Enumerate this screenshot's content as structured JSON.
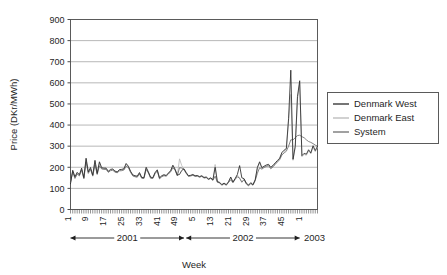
{
  "chart_data": {
    "type": "line",
    "title": "",
    "xlabel": "Week",
    "ylabel": "Price (DKr/MWh)",
    "ylim": [
      0,
      900
    ],
    "ytick_values": [
      0,
      100,
      200,
      300,
      400,
      500,
      600,
      700,
      800,
      900
    ],
    "ytick_labels": [
      "0",
      "100",
      "200",
      "300",
      "400",
      "500",
      "600",
      "700",
      "800",
      "900"
    ],
    "grid": true,
    "legend_position": "right",
    "xlim": [
      1,
      110
    ],
    "x_index_range": [
      1,
      110
    ],
    "xtick_positions": [
      1,
      9,
      17,
      25,
      33,
      41,
      49,
      57,
      65,
      73,
      81,
      89,
      97,
      105
    ],
    "xtick_labels": [
      "1",
      "9",
      "17",
      "25",
      "33",
      "41",
      "49",
      "5",
      "13",
      "21",
      "29",
      "37",
      "45",
      "1"
    ],
    "period_brackets": [
      {
        "label": "2001",
        "start_index": 1,
        "end_index": 52,
        "style": "double-arrow"
      },
      {
        "label": "2002",
        "start_index": 53,
        "end_index": 104,
        "style": "double-arrow"
      },
      {
        "label": "2003",
        "start_index": 105,
        "end_index": 110,
        "style": "text-right"
      }
    ],
    "series": [
      {
        "name": "Denmark West",
        "color": "#2b2b2b",
        "values": [
          122,
          186,
          155,
          176,
          165,
          196,
          151,
          243,
          178,
          199,
          163,
          233,
          171,
          226,
          198,
          196,
          196,
          181,
          190,
          192,
          182,
          178,
          189,
          190,
          193,
          218,
          205,
          181,
          164,
          160,
          158,
          175,
          152,
          151,
          200,
          178,
          153,
          151,
          175,
          188,
          150,
          160,
          165,
          161,
          173,
          184,
          210,
          191,
          163,
          166,
          185,
          193,
          175,
          160,
          162,
          166,
          160,
          161,
          156,
          160,
          152,
          154,
          145,
          150,
          141,
          200,
          132,
          129,
          118,
          125,
          118,
          131,
          154,
          130,
          147,
          166,
          208,
          150,
          146,
          125,
          116,
          127,
          118,
          141,
          200,
          226,
          198,
          205,
          211,
          214,
          200,
          209,
          221,
          232,
          243,
          270,
          281,
          289,
          430,
          660,
          238,
          300,
          535,
          610,
          255,
          266,
          262,
          283,
          268,
          302,
          279,
          300
        ]
      },
      {
        "name": "Denmark East",
        "color": "#b9b9b9",
        "values": [
          126,
          182,
          150,
          171,
          162,
          191,
          148,
          238,
          174,
          194,
          160,
          228,
          168,
          221,
          195,
          193,
          193,
          178,
          187,
          189,
          179,
          176,
          186,
          187,
          190,
          214,
          202,
          178,
          161,
          157,
          155,
          172,
          150,
          148,
          196,
          175,
          150,
          148,
          172,
          185,
          147,
          157,
          162,
          159,
          170,
          181,
          206,
          188,
          161,
          240,
          208,
          190,
          173,
          158,
          160,
          164,
          158,
          159,
          154,
          158,
          150,
          152,
          143,
          148,
          139,
          213,
          130,
          127,
          116,
          123,
          116,
          129,
          151,
          128,
          144,
          163,
          150,
          130,
          143,
          122,
          113,
          124,
          116,
          138,
          196,
          221,
          194,
          201,
          207,
          210,
          196,
          205,
          217,
          228,
          239,
          265,
          276,
          284,
          421,
          545,
          233,
          294,
          524,
          600,
          250,
          261,
          257,
          278,
          263,
          296,
          274,
          294
        ]
      },
      {
        "name": "System",
        "color": "#6f6f6f",
        "values": [
          130,
          178,
          147,
          168,
          159,
          187,
          146,
          226,
          171,
          190,
          158,
          212,
          166,
          207,
          192,
          190,
          190,
          176,
          184,
          186,
          177,
          174,
          183,
          184,
          187,
          205,
          199,
          176,
          159,
          155,
          153,
          169,
          148,
          147,
          190,
          173,
          148,
          147,
          170,
          182,
          145,
          155,
          160,
          158,
          168,
          179,
          198,
          186,
          160,
          198,
          196,
          188,
          171,
          157,
          159,
          162,
          157,
          158,
          153,
          157,
          149,
          151,
          142,
          147,
          138,
          158,
          129,
          126,
          115,
          122,
          115,
          128,
          141,
          127,
          143,
          155,
          148,
          129,
          142,
          121,
          112,
          123,
          115,
          137,
          172,
          198,
          191,
          199,
          204,
          207,
          193,
          202,
          214,
          225,
          236,
          258,
          268,
          276,
          300,
          330,
          330,
          340,
          350,
          352,
          345,
          340,
          330,
          322,
          318,
          312,
          305,
          300
        ]
      }
    ]
  },
  "legend": {
    "items": [
      {
        "label": "Denmark West",
        "color": "#2b2b2b"
      },
      {
        "label": "Denmark East",
        "color": "#b9b9b9"
      },
      {
        "label": "System",
        "color": "#6f6f6f"
      }
    ]
  }
}
